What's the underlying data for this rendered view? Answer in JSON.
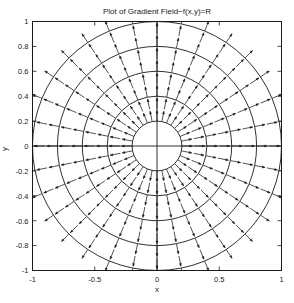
{
  "figure": {
    "title": "Plot of Gradient Field−f(x,y)=R",
    "xlabel": "x",
    "ylabel": "y",
    "background_color": "#ffffff",
    "line_color": "#1a1a1a",
    "text_color": "#1a1a1a"
  },
  "chart_data": {
    "type": "scatter",
    "plot_kind": "quiver-with-contours",
    "title": "Plot of Gradient Field−f(x,y)=R",
    "xlabel": "x",
    "ylabel": "y",
    "xlim": [
      -1,
      1
    ],
    "ylim": [
      -1,
      1
    ],
    "grid": false,
    "legend": null,
    "xticks": [
      -1,
      -0.5,
      0,
      0.5,
      1
    ],
    "xticklabels": [
      "-1",
      "-0.5",
      "0",
      "0.5",
      "1"
    ],
    "yticks": [
      -1,
      -0.8,
      -0.6,
      -0.4,
      -0.2,
      0,
      0.2,
      0.4,
      0.6,
      0.8,
      1
    ],
    "yticklabels": [
      "-1",
      "-0.8",
      "-0.6",
      "-0.4",
      "-0.2",
      "0",
      "0.2",
      "0.4",
      "0.6",
      "0.8",
      "1"
    ],
    "contours": {
      "description": "Concentric circles of constant R = sqrt(x^2+y^2)",
      "levels": [
        0.2,
        0.4,
        0.6,
        0.8,
        1.0
      ],
      "color": "#1a1a1a"
    },
    "vector_field": {
      "description": "Unit radial arrows of the gradient of f(x,y)=R pointing outward from the origin",
      "function": "f(x,y)=R=sqrt(x^2+y^2)",
      "gradient": "(x/R, y/R)",
      "grid_type": "polar",
      "radii": [
        0.2,
        0.3,
        0.4,
        0.5,
        0.6,
        0.7,
        0.8,
        0.9,
        1.0
      ],
      "angles_count": 32,
      "arrow_length": 0.085,
      "color": "#1a1a1a",
      "inner_blank_radius": 0.18
    },
    "axes_cross": {
      "horizontal_axis_y": 0,
      "vertical_axis_x": 0
    }
  }
}
